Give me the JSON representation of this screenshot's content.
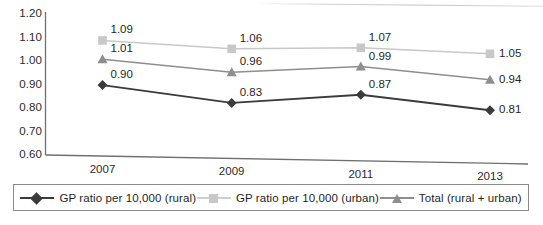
{
  "chart_data": {
    "type": "line",
    "title": "",
    "subtitle": "",
    "xlabel": "",
    "ylabel": "",
    "categories": [
      "2007",
      "2009",
      "2011",
      "2013"
    ],
    "ylim": [
      0.6,
      1.2
    ],
    "ytick_labels": [
      "1.20",
      "1.10",
      "1.00",
      "0.90",
      "0.80",
      "0.70",
      "0.60"
    ],
    "ytick_values": [
      1.2,
      1.1,
      1.0,
      0.9,
      0.8,
      0.7,
      0.6
    ],
    "grid": false,
    "legend_position": "bottom",
    "series": [
      {
        "name": "GP ratio per 10,000 (rural)",
        "marker": "diamond",
        "color": "#3b3b3b",
        "values": [
          0.9,
          0.83,
          0.87,
          0.81
        ],
        "labels": [
          "0.90",
          "0.83",
          "0.87",
          "0.81"
        ]
      },
      {
        "name": "GP ratio per 10,000 (urban)",
        "marker": "square",
        "color": "#c8c8c8",
        "values": [
          1.09,
          1.06,
          1.07,
          1.05
        ],
        "labels": [
          "1.09",
          "1.06",
          "1.07",
          "1.05"
        ]
      },
      {
        "name": "Total (rural + urban)",
        "marker": "triangle",
        "color": "#8e8e8e",
        "values": [
          1.01,
          0.96,
          0.99,
          0.94
        ],
        "labels": [
          "1.01",
          "0.96",
          "0.99",
          "0.94"
        ]
      }
    ]
  },
  "axes": {
    "axis_color": "#6f6f6f"
  },
  "legend": {
    "items": [
      {
        "label": "GP ratio per 10,000 (rural)"
      },
      {
        "label": "GP ratio per 10,000 (urban)"
      },
      {
        "label": "Total (rural + urban)"
      }
    ]
  }
}
